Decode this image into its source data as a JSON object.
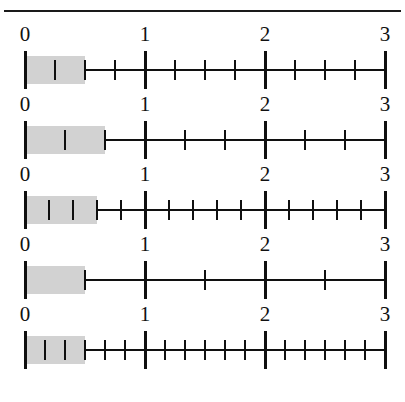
{
  "page": {
    "background_color": "#ffffff",
    "rule_color": "#1a1a1a",
    "ink_color": "#101010",
    "shade_color": "#d2d2d2"
  },
  "axis": {
    "min": 0,
    "max": 3,
    "major_labels": [
      "0",
      "1",
      "2",
      "3"
    ],
    "left_px": 25,
    "right_px": 385
  },
  "chart_data": {
    "type": "numberline",
    "xlabel": "",
    "ylabel": "",
    "xlim": [
      0,
      3
    ],
    "grid": false,
    "legend": "none",
    "major_ticks": [
      0,
      1,
      2,
      3
    ],
    "tick_labels": [
      "0",
      "1",
      "2",
      "3"
    ],
    "series": [
      {
        "name": "line-1",
        "denominator": 4,
        "subdivisions_per_unit": 4,
        "shaded_start": 0,
        "shaded_end_numerator": 2,
        "shaded_end_value": 0.5,
        "fraction": "2/4"
      },
      {
        "name": "line-2",
        "denominator": 3,
        "subdivisions_per_unit": 3,
        "shaded_start": 0,
        "shaded_end_numerator": 2,
        "shaded_end_value": 0.6667,
        "fraction": "2/3"
      },
      {
        "name": "line-3",
        "denominator": 5,
        "subdivisions_per_unit": 5,
        "shaded_start": 0,
        "shaded_end_numerator": 3,
        "shaded_end_value": 0.6,
        "fraction": "3/5"
      },
      {
        "name": "line-4",
        "denominator": 2,
        "subdivisions_per_unit": 2,
        "shaded_start": 0,
        "shaded_end_numerator": 1,
        "shaded_end_value": 0.5,
        "fraction": "1/2"
      },
      {
        "name": "line-5",
        "denominator": 6,
        "subdivisions_per_unit": 6,
        "shaded_start": 0,
        "shaded_end_numerator": 3,
        "shaded_end_value": 0.5,
        "fraction": "3/6"
      }
    ]
  }
}
